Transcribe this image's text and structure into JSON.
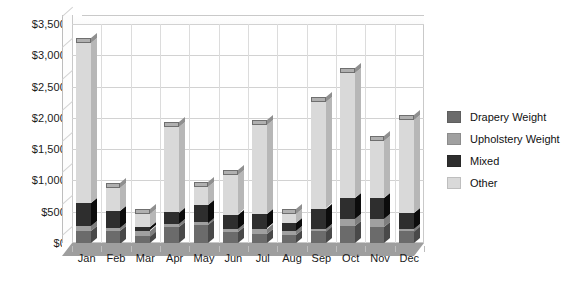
{
  "chart_data": {
    "type": "bar",
    "subtype": "stacked-column-3d",
    "title": "",
    "xlabel": "",
    "ylabel": "",
    "categories": [
      "Jan",
      "Feb",
      "Mar",
      "Apr",
      "May",
      "Jun",
      "Jul",
      "Aug",
      "Sep",
      "Oct",
      "Nov",
      "Dec"
    ],
    "series": [
      {
        "name": "Drapery Weight",
        "color": "#6b6b6b",
        "values": [
          190,
          200,
          110,
          250,
          290,
          180,
          150,
          130,
          190,
          270,
          260,
          190
        ]
      },
      {
        "name": "Upholstery Weight",
        "color": "#a0a0a0",
        "values": [
          80,
          40,
          90,
          50,
          40,
          40,
          80,
          70,
          40,
          110,
          120,
          40
        ]
      },
      {
        "name": "Mixed",
        "color": "#2e2e2e",
        "values": [
          370,
          270,
          50,
          190,
          280,
          230,
          230,
          120,
          320,
          340,
          340,
          250
        ]
      },
      {
        "name": "Other",
        "color": "#d9d9d9",
        "values": [
          2560,
          370,
          210,
          1370,
          280,
          630,
          1430,
          140,
          1700,
          2000,
          910,
          1490
        ]
      }
    ],
    "totals": [
      3200,
      880,
      460,
      1860,
      890,
      1080,
      1890,
      460,
      2250,
      2720,
      1630,
      1970
    ],
    "ylim": [
      0,
      3500
    ],
    "ytick_step": 500,
    "ytick_labels": [
      "$0",
      "$500",
      "$1,000",
      "$1,500",
      "$2,000",
      "$2,500",
      "$3,000",
      "$3,500"
    ],
    "ytick_values": [
      0,
      500,
      1000,
      1500,
      2000,
      2500,
      3000,
      3500
    ],
    "grid": true,
    "legend_position": "right",
    "plot_background": "#ffffff",
    "gridline_color": "#d2d2d2"
  },
  "legend": {
    "items": [
      {
        "label": "Drapery Weight"
      },
      {
        "label": "Upholstery Weight"
      },
      {
        "label": "Mixed"
      },
      {
        "label": "Other"
      }
    ]
  }
}
